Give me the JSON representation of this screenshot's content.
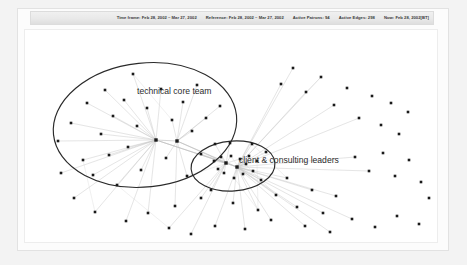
{
  "status_bar": {
    "items": [
      "Time frame: Feb 28, 2002 – Mar 27, 2002",
      "Reference: Feb 28, 2002 – Mar 27, 2002",
      "Active Patrons: 94",
      "Active Edges: 298",
      "Now: Feb 28, 2002[BT]"
    ]
  },
  "chart_data": {
    "type": "scatter",
    "title": "",
    "xlabel": "",
    "ylabel": "",
    "xlim": [
      0,
      414
    ],
    "ylim": [
      0,
      214
    ],
    "grid": false,
    "legend_position": "none",
    "node_color": "#1a1a1a",
    "edge_color": "#c8c8c8",
    "ellipse_color": "#2a2a2a",
    "annotations": [
      {
        "text": "technical core team",
        "x": 112,
        "y": 64
      },
      {
        "text": "client & consulting leaders",
        "x": 214,
        "y": 133
      }
    ],
    "clusters": [
      {
        "name": "technical core team",
        "cx": 120,
        "cy": 95,
        "rx": 92,
        "ry": 62,
        "rotate": -6
      },
      {
        "name": "client & consulting leaders",
        "cx": 208,
        "cy": 136,
        "rx": 42,
        "ry": 25,
        "rotate": -4
      }
    ],
    "hubs": [
      {
        "x": 131,
        "y": 110
      },
      {
        "x": 152,
        "y": 111
      },
      {
        "x": 201,
        "y": 133
      },
      {
        "x": 212,
        "y": 137
      }
    ],
    "nodes": [
      {
        "x": 33,
        "y": 111
      },
      {
        "x": 46,
        "y": 93
      },
      {
        "x": 58,
        "y": 130
      },
      {
        "x": 62,
        "y": 73
      },
      {
        "x": 68,
        "y": 145
      },
      {
        "x": 76,
        "y": 104
      },
      {
        "x": 80,
        "y": 60
      },
      {
        "x": 84,
        "y": 125
      },
      {
        "x": 88,
        "y": 86
      },
      {
        "x": 92,
        "y": 155
      },
      {
        "x": 99,
        "y": 70
      },
      {
        "x": 103,
        "y": 117
      },
      {
        "x": 108,
        "y": 44
      },
      {
        "x": 112,
        "y": 96
      },
      {
        "x": 116,
        "y": 140
      },
      {
        "x": 122,
        "y": 78
      },
      {
        "x": 131,
        "y": 110
      },
      {
        "x": 136,
        "y": 59
      },
      {
        "x": 141,
        "y": 128
      },
      {
        "x": 147,
        "y": 90
      },
      {
        "x": 152,
        "y": 111
      },
      {
        "x": 158,
        "y": 72
      },
      {
        "x": 162,
        "y": 146
      },
      {
        "x": 167,
        "y": 101
      },
      {
        "x": 172,
        "y": 55
      },
      {
        "x": 176,
        "y": 124
      },
      {
        "x": 181,
        "y": 88
      },
      {
        "x": 186,
        "y": 160
      },
      {
        "x": 190,
        "y": 114
      },
      {
        "x": 195,
        "y": 76
      },
      {
        "x": 199,
        "y": 143
      },
      {
        "x": 201,
        "y": 133
      },
      {
        "x": 206,
        "y": 126
      },
      {
        "x": 209,
        "y": 148
      },
      {
        "x": 212,
        "y": 137
      },
      {
        "x": 215,
        "y": 129
      },
      {
        "x": 218,
        "y": 144
      },
      {
        "x": 221,
        "y": 134
      },
      {
        "x": 224,
        "y": 126
      },
      {
        "x": 196,
        "y": 127
      },
      {
        "x": 193,
        "y": 139
      },
      {
        "x": 189,
        "y": 131
      },
      {
        "x": 228,
        "y": 141
      },
      {
        "x": 232,
        "y": 131
      },
      {
        "x": 236,
        "y": 150
      },
      {
        "x": 205,
        "y": 113
      },
      {
        "x": 227,
        "y": 114
      },
      {
        "x": 241,
        "y": 122
      },
      {
        "x": 176,
        "y": 168
      },
      {
        "x": 150,
        "y": 176
      },
      {
        "x": 123,
        "y": 183
      },
      {
        "x": 101,
        "y": 191
      },
      {
        "x": 208,
        "y": 173
      },
      {
        "x": 233,
        "y": 180
      },
      {
        "x": 251,
        "y": 165
      },
      {
        "x": 262,
        "y": 148
      },
      {
        "x": 272,
        "y": 177
      },
      {
        "x": 287,
        "y": 160
      },
      {
        "x": 298,
        "y": 183
      },
      {
        "x": 311,
        "y": 166
      },
      {
        "x": 256,
        "y": 54
      },
      {
        "x": 268,
        "y": 38
      },
      {
        "x": 281,
        "y": 62
      },
      {
        "x": 296,
        "y": 47
      },
      {
        "x": 309,
        "y": 75
      },
      {
        "x": 322,
        "y": 58
      },
      {
        "x": 334,
        "y": 88
      },
      {
        "x": 347,
        "y": 66
      },
      {
        "x": 356,
        "y": 95
      },
      {
        "x": 366,
        "y": 73
      },
      {
        "x": 374,
        "y": 104
      },
      {
        "x": 383,
        "y": 82
      },
      {
        "x": 330,
        "y": 127
      },
      {
        "x": 344,
        "y": 141
      },
      {
        "x": 358,
        "y": 123
      },
      {
        "x": 370,
        "y": 146
      },
      {
        "x": 384,
        "y": 130
      },
      {
        "x": 396,
        "y": 152
      },
      {
        "x": 49,
        "y": 168
      },
      {
        "x": 70,
        "y": 182
      },
      {
        "x": 36,
        "y": 143
      },
      {
        "x": 144,
        "y": 198
      },
      {
        "x": 166,
        "y": 204
      },
      {
        "x": 190,
        "y": 196
      },
      {
        "x": 220,
        "y": 199
      },
      {
        "x": 246,
        "y": 190
      },
      {
        "x": 280,
        "y": 196
      },
      {
        "x": 305,
        "y": 202
      },
      {
        "x": 327,
        "y": 189
      },
      {
        "x": 350,
        "y": 197
      },
      {
        "x": 372,
        "y": 186
      },
      {
        "x": 394,
        "y": 194
      },
      {
        "x": 404,
        "y": 168
      }
    ]
  }
}
